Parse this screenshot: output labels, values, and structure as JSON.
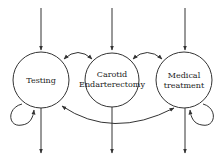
{
  "diagram": {
    "type": "state-transition",
    "line_color": "#333333",
    "background": "#ffffff",
    "nodes": [
      {
        "id": "testing",
        "lines": [
          "Testing"
        ]
      },
      {
        "id": "carotid-endarterectomy",
        "lines": [
          "Carotid",
          "Endarterectomy"
        ]
      },
      {
        "id": "medical-treatment",
        "lines": [
          "Medical",
          "treatment"
        ]
      }
    ],
    "edges": [
      {
        "from": "entry",
        "to": "testing"
      },
      {
        "from": "entry",
        "to": "carotid-endarterectomy"
      },
      {
        "from": "entry",
        "to": "medical-treatment"
      },
      {
        "from": "testing",
        "to": "carotid-endarterectomy",
        "bidirectional": true
      },
      {
        "from": "carotid-endarterectomy",
        "to": "medical-treatment",
        "bidirectional": true
      },
      {
        "from": "testing",
        "to": "medical-treatment",
        "bidirectional": true
      },
      {
        "from": "testing",
        "to": "testing",
        "self_loop": true
      },
      {
        "from": "medical-treatment",
        "to": "medical-treatment",
        "self_loop": true
      },
      {
        "from": "testing",
        "to": "exit"
      },
      {
        "from": "carotid-endarterectomy",
        "to": "exit"
      },
      {
        "from": "medical-treatment",
        "to": "exit"
      }
    ]
  }
}
